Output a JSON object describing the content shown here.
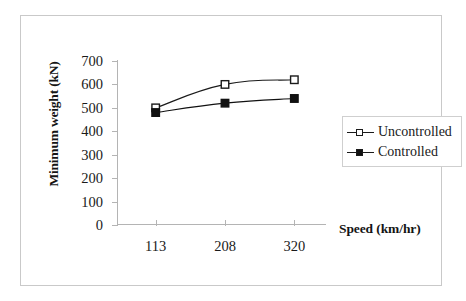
{
  "chart_data": {
    "type": "line",
    "title": "",
    "subtitle": "",
    "xlabel": "Speed (km/hr)",
    "ylabel": "Minimum weight (kN)",
    "categories": [
      "113",
      "208",
      "320"
    ],
    "series": [
      {
        "name": "Uncontrolled",
        "values": [
          500,
          600,
          620
        ],
        "marker": "open-square",
        "color": "#1a1a1a"
      },
      {
        "name": "Controlled",
        "values": [
          480,
          520,
          540
        ],
        "marker": "filled-square",
        "color": "#111111"
      }
    ],
    "y_ticks": [
      0,
      100,
      200,
      300,
      400,
      500,
      600,
      700
    ],
    "y_tick_labels": [
      "0",
      "100",
      "200",
      "300",
      "400",
      "500",
      "600",
      "700"
    ],
    "ylim": [
      0,
      700
    ],
    "grid": false,
    "legend_position": "right-middle",
    "legend_entries": [
      "Uncontrolled",
      "Controlled"
    ],
    "smoothed_lines": true
  },
  "axes": {
    "y_title": "Minimum weight (kN)",
    "x_title": "Speed (km/hr)"
  },
  "legend": {
    "items": [
      {
        "label": "Uncontrolled",
        "marker": "open-square"
      },
      {
        "label": "Controlled",
        "marker": "filled-square"
      }
    ]
  },
  "colors": {
    "frame": "#c9c9c9",
    "axis": "#b4b4b4",
    "series_line": "#1a1a1a",
    "text": "#1a1a1a",
    "background": "#ffffff"
  }
}
